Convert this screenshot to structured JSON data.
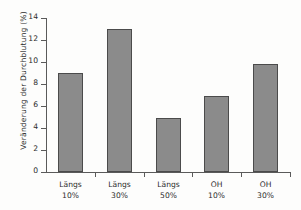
{
  "chart_data": {
    "type": "bar",
    "title": "",
    "xlabel": "",
    "ylabel": "Veränderung der Durchblutung (%)",
    "categories": [
      "Längs 10%",
      "Längs 30%",
      "Längs 50%",
      "OH 10%",
      "OH 30%"
    ],
    "category_lines": [
      {
        "line1": "Längs",
        "line2": "10%"
      },
      {
        "line1": "Längs",
        "line2": "30%"
      },
      {
        "line1": "Längs",
        "line2": "50%"
      },
      {
        "line1": "OH",
        "line2": "10%"
      },
      {
        "line1": "OH",
        "line2": "30%"
      }
    ],
    "values": [
      9.0,
      13.0,
      4.9,
      6.9,
      9.8
    ],
    "ylim": [
      0,
      14
    ],
    "yticks": [
      0,
      2,
      4,
      6,
      8,
      10,
      12,
      14
    ],
    "ytick_labels": [
      "0",
      "2",
      "4",
      "6",
      "8",
      "10",
      "12",
      "14"
    ],
    "grid": false,
    "legend": null,
    "bar_color": "#8b8b8b",
    "bar_edge_color": "#4b4b4b",
    "axis_color": "#5a5a5a",
    "background_color": "#fdfdfc"
  }
}
